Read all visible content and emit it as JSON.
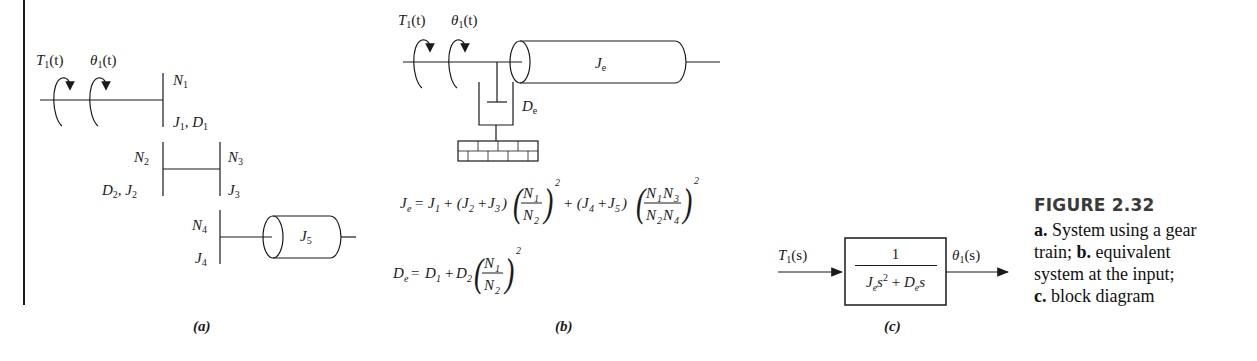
{
  "figure": {
    "title": "FIGURE 2.32",
    "caption_lines": [
      {
        "prefix": "a.",
        "text": " System using a gear"
      },
      {
        "prefix": "",
        "text": "train; "
      },
      {
        "prefix": "b.",
        "text": " equivalent"
      },
      {
        "prefix": "",
        "text": "system at the input;"
      },
      {
        "prefix": "c.",
        "text": " block diagram"
      }
    ]
  },
  "panel_a": {
    "caption": "(a)",
    "torque_label": "T",
    "torque_sub": "1",
    "torque_arg": "(t)",
    "angle_label": "θ",
    "angle_sub": "1",
    "angle_arg": "(t)",
    "gear1": {
      "n": "N",
      "n_sub": "1",
      "jd": "J",
      "jd_sub": "1",
      "jd2": ", D",
      "jd2_sub": "1"
    },
    "gear2": {
      "n": "N",
      "n_sub": "2",
      "dj": "D",
      "dj_sub": "2",
      "dj2": ", J",
      "dj2_sub": "2"
    },
    "gear3": {
      "n": "N",
      "n_sub": "3",
      "j": "J",
      "j_sub": "3"
    },
    "gear4": {
      "n": "N",
      "n_sub": "4",
      "j": "J",
      "j_sub": "4"
    },
    "load": {
      "j": "J",
      "j_sub": "5"
    }
  },
  "panel_b": {
    "caption": "(b)",
    "torque_label": "T",
    "torque_sub": "1",
    "torque_arg": "(t)",
    "angle_label": "θ",
    "angle_sub": "1",
    "angle_arg": "(t)",
    "inertia": {
      "j": "J",
      "j_sub": "e"
    },
    "damper": {
      "d": "D",
      "d_sub": "e"
    },
    "eq_je": "J_e = J_1 + (J_2 + J_3) (N_1/N_2)^2 + (J_4 + J_5) (N_1N_3/N_2N_4)^2",
    "eq_de": "D_e = D_1 + D_2 (N_1/N_2)^2"
  },
  "panel_c": {
    "caption": "(c)",
    "input": {
      "label": "T",
      "sub": "1",
      "arg": "(s)"
    },
    "output": {
      "label": "θ",
      "sub": "1",
      "arg": "(s)"
    },
    "transfer_function": {
      "numerator": "1",
      "denominator": "J_e s^2 + D_e s"
    }
  }
}
